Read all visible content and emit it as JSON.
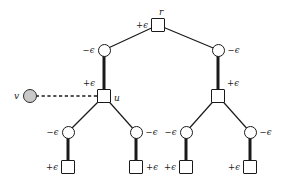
{
  "figure": {
    "background": "#ffffff",
    "stroke_color": "#1a1a1a",
    "fill_gray": "#c9c9c9",
    "width": 283,
    "height": 183
  },
  "labels": {
    "plus_eps": "+ϵ",
    "minus_eps": "−ϵ",
    "node_r": "r",
    "node_u": "u",
    "node_v": "v"
  },
  "nodes": [
    {
      "id": "r",
      "shape": "square",
      "x": 158,
      "y": 25,
      "name_label": "r",
      "name_pos": "above-right",
      "eps": "+ϵ",
      "eps_pos": "left"
    },
    {
      "id": "c1",
      "shape": "circle",
      "x": 104,
      "y": 50,
      "name_label": "",
      "name_pos": "",
      "eps": "−ϵ",
      "eps_pos": "left"
    },
    {
      "id": "c2",
      "shape": "circle",
      "x": 218,
      "y": 50,
      "name_label": "",
      "name_pos": "",
      "eps": "−ϵ",
      "eps_pos": "right"
    },
    {
      "id": "u",
      "shape": "square",
      "x": 104,
      "y": 96,
      "name_label": "u",
      "name_pos": "right",
      "eps": "+ϵ",
      "eps_pos": "above-left"
    },
    {
      "id": "s2",
      "shape": "square",
      "x": 218,
      "y": 96,
      "name_label": "",
      "name_pos": "",
      "eps": "+ϵ",
      "eps_pos": "above-right"
    },
    {
      "id": "v",
      "shape": "circle-filled",
      "x": 30,
      "y": 96,
      "name_label": "v",
      "name_pos": "left",
      "eps": "",
      "eps_pos": ""
    },
    {
      "id": "c3",
      "shape": "circle",
      "x": 68,
      "y": 132,
      "name_label": "",
      "name_pos": "",
      "eps": "−ϵ",
      "eps_pos": "left"
    },
    {
      "id": "c4",
      "shape": "circle",
      "x": 136,
      "y": 132,
      "name_label": "",
      "name_pos": "",
      "eps": "−ϵ",
      "eps_pos": "right"
    },
    {
      "id": "c5",
      "shape": "circle",
      "x": 186,
      "y": 132,
      "name_label": "",
      "name_pos": "",
      "eps": "−ϵ",
      "eps_pos": "left"
    },
    {
      "id": "c6",
      "shape": "circle",
      "x": 250,
      "y": 132,
      "name_label": "",
      "name_pos": "",
      "eps": "−ϵ",
      "eps_pos": "right"
    },
    {
      "id": "q1",
      "shape": "square",
      "x": 68,
      "y": 167,
      "name_label": "",
      "name_pos": "",
      "eps": "+ϵ",
      "eps_pos": "left"
    },
    {
      "id": "q2",
      "shape": "square",
      "x": 136,
      "y": 167,
      "name_label": "",
      "name_pos": "",
      "eps": "+ϵ",
      "eps_pos": "right"
    },
    {
      "id": "q3",
      "shape": "square",
      "x": 186,
      "y": 167,
      "name_label": "",
      "name_pos": "",
      "eps": "+ϵ",
      "eps_pos": "left"
    },
    {
      "id": "q4",
      "shape": "square",
      "x": 250,
      "y": 167,
      "name_label": "",
      "name_pos": "",
      "eps": "+ϵ",
      "eps_pos": "left"
    }
  ],
  "edges": [
    {
      "from": "r",
      "to": "c1",
      "style": "thin"
    },
    {
      "from": "r",
      "to": "c2",
      "style": "thin"
    },
    {
      "from": "c1",
      "to": "u",
      "style": "thick"
    },
    {
      "from": "c2",
      "to": "s2",
      "style": "thick"
    },
    {
      "from": "v",
      "to": "u",
      "style": "dashed"
    },
    {
      "from": "u",
      "to": "c3",
      "style": "thin"
    },
    {
      "from": "u",
      "to": "c4",
      "style": "thin"
    },
    {
      "from": "s2",
      "to": "c5",
      "style": "thin"
    },
    {
      "from": "s2",
      "to": "c6",
      "style": "thin"
    },
    {
      "from": "c3",
      "to": "q1",
      "style": "thick"
    },
    {
      "from": "c4",
      "to": "q2",
      "style": "thick"
    },
    {
      "from": "c5",
      "to": "q3",
      "style": "thick"
    },
    {
      "from": "c6",
      "to": "q4",
      "style": "thick"
    }
  ]
}
